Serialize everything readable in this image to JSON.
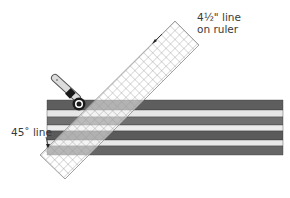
{
  "diagram": {
    "labels": {
      "ruler_line_1": "4½\" line",
      "ruler_line_2": "on ruler",
      "angle_line": "45˚ line"
    },
    "stripes": [
      {
        "y": 100,
        "h": 10,
        "color": "#5e5e5e"
      },
      {
        "y": 110,
        "h": 7,
        "color": "#e6e6e6"
      },
      {
        "y": 117,
        "h": 8,
        "color": "#707070"
      },
      {
        "y": 125,
        "h": 6,
        "color": "#ececec"
      },
      {
        "y": 131,
        "h": 9,
        "color": "#5a5a5a"
      },
      {
        "y": 140,
        "h": 6,
        "color": "#e8e8e8"
      },
      {
        "y": 146,
        "h": 9,
        "color": "#666666"
      }
    ],
    "colors": {
      "ruler_grid": "#9a9a9a",
      "ruler_edge": "#8a8a8a",
      "label_text": "#3a3a3a",
      "cutter_handle": "#d8d8d8",
      "cutter_dark": "#1a1a1a"
    }
  }
}
